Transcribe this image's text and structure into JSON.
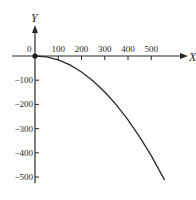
{
  "chart_data": {
    "type": "line",
    "title": "",
    "xlabel": "X",
    "ylabel": "Y",
    "xlim": [
      0,
      560
    ],
    "ylim": [
      -520,
      0
    ],
    "grid": false,
    "legend": null,
    "origin_label": "0",
    "x_ticks": [
      100,
      200,
      300,
      400,
      500
    ],
    "x_tick_labels": [
      "100",
      "200",
      "300",
      "400",
      "500"
    ],
    "y_ticks": [
      -100,
      -200,
      -300,
      -400,
      -500
    ],
    "y_tick_labels": [
      "-100",
      "-200",
      "-300",
      "-400",
      "-500"
    ],
    "series": [
      {
        "name": "trajectory",
        "x": [
          0,
          50,
          100,
          150,
          200,
          250,
          300,
          350,
          400,
          450,
          500,
          557
        ],
        "y": [
          0,
          -4,
          -16,
          -37,
          -66,
          -103,
          -149,
          -202,
          -264,
          -334,
          -412,
          -512
        ]
      }
    ],
    "annotations": [
      {
        "type": "point",
        "x": 0,
        "y": 0,
        "label": "origin dot"
      }
    ]
  }
}
